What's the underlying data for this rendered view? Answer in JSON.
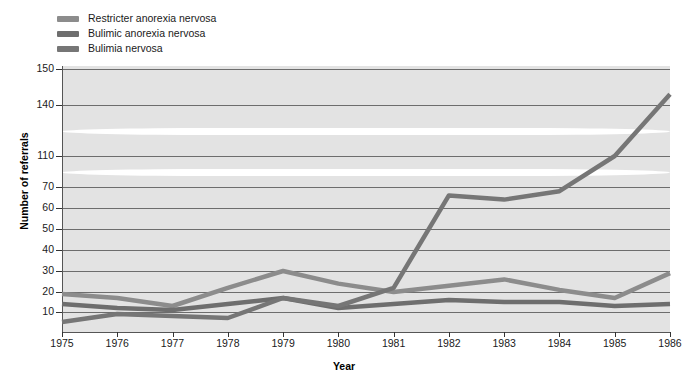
{
  "chart_data": {
    "type": "line",
    "title": "",
    "xlabel": "Year",
    "ylabel": "Number of referrals",
    "x": [
      1975,
      1976,
      1977,
      1978,
      1979,
      1980,
      1981,
      1982,
      1983,
      1984,
      1985,
      1986
    ],
    "categories": [
      "1975",
      "1976",
      "1977",
      "1978",
      "1979",
      "1980",
      "1981",
      "1982",
      "1983",
      "1984",
      "1985",
      "1986"
    ],
    "ytick_labels": [
      "10",
      "20",
      "30",
      "40",
      "50",
      "60",
      "70",
      "110",
      "140",
      "150"
    ],
    "ytick_values": [
      10,
      20,
      30,
      40,
      50,
      60,
      70,
      110,
      140,
      150
    ],
    "axis_broken": true,
    "axis_break_notes": "Y axis compressed between 70 and 110, and between 110 and 140",
    "ylim": [
      0,
      150
    ],
    "grid": true,
    "legend_position": "top-left",
    "series": [
      {
        "name": "Restricter anorexia nervosa",
        "color": "#8c8c8c",
        "values": [
          19,
          17,
          13,
          22,
          30,
          24,
          20,
          23,
          26,
          21,
          17,
          29
        ]
      },
      {
        "name": "Bulimic anorexia nervosa",
        "color": "#6e6e6e",
        "values": [
          14,
          12,
          11,
          14,
          17,
          12,
          14,
          16,
          15,
          15,
          13,
          14
        ]
      },
      {
        "name": "Bulimia nervosa",
        "color": "#767676",
        "values": [
          5,
          9,
          8,
          7,
          17,
          13,
          22,
          66,
          64,
          68,
          110,
          143
        ]
      }
    ]
  },
  "legend": {
    "items": [
      {
        "label": "Restricter anorexia nervosa",
        "color": "#8c8c8c"
      },
      {
        "label": "Bulimic anorexia nervosa",
        "color": "#6e6e6e"
      },
      {
        "label": "Bulimia nervosa",
        "color": "#767676"
      }
    ]
  },
  "axes": {
    "y_title": "Number of referrals",
    "x_title": "Year"
  }
}
